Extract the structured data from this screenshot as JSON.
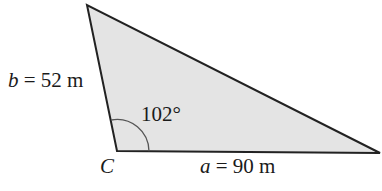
{
  "diagram": {
    "type": "triangle",
    "fill_color": "#e4e4e4",
    "stroke_color": "#222222",
    "vertices": {
      "top": [
        87,
        5
      ],
      "C": [
        117,
        151
      ],
      "right": [
        380,
        153
      ]
    },
    "labels": {
      "side_b": {
        "var": "b",
        "rest": " = 52 m"
      },
      "side_a": {
        "var": "a",
        "rest": " = 90 m"
      },
      "angle_C": "102°",
      "vertex_C": "C"
    }
  }
}
